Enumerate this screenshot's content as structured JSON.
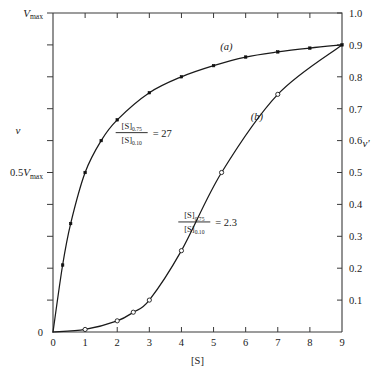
{
  "figure": {
    "background_color": "#ffffff",
    "ink_color": "#1a1a1a",
    "axis_color": "#3a3a3a"
  },
  "chart_data": {
    "type": "line",
    "title": "",
    "subtitle": "",
    "xlabel": "[S]",
    "ylabel": "v",
    "y2label": "v'",
    "xlim": [
      0,
      9
    ],
    "ylim": [
      0,
      1.0
    ],
    "y2lim": [
      0,
      1.0
    ],
    "grid": false,
    "legend_position": "inline-curve-labels",
    "x_ticks": [
      0,
      1,
      2,
      3,
      4,
      5,
      6,
      7,
      8,
      9
    ],
    "x_tick_labels": [
      "0",
      "1",
      "2",
      "3",
      "4",
      "5",
      "6",
      "7",
      "8",
      "9"
    ],
    "y_left_ticks": [
      0.1,
      0.2,
      0.3,
      0.4,
      0.5,
      0.6,
      0.7,
      0.8,
      0.9,
      1.0
    ],
    "y_left_labeled": [
      {
        "value": 1.0,
        "prefix": "",
        "symbol": "V",
        "subscript": "max"
      },
      {
        "value": 0.5,
        "prefix": "0.5",
        "symbol": "V",
        "subscript": "max"
      },
      {
        "value": 0.0,
        "prefix": "0",
        "symbol": "",
        "subscript": ""
      }
    ],
    "y_right_ticks": [
      0.1,
      0.2,
      0.3,
      0.4,
      0.5,
      0.6,
      0.7,
      0.8,
      0.9,
      1.0
    ],
    "y_right_tick_labels": [
      "0.1",
      "0.2",
      "0.3",
      "0.4",
      "0.5",
      "0.6",
      "0.7",
      "0.8",
      "0.9",
      "1.0"
    ],
    "series": [
      {
        "name": "(a)",
        "label": "(a)",
        "marker": "filled-square",
        "description": "hyperbolic Michaelis-Menten saturation curve",
        "points": [
          {
            "x": 0.0,
            "y": 0.0
          },
          {
            "x": 0.3,
            "y": 0.21
          },
          {
            "x": 0.55,
            "y": 0.34
          },
          {
            "x": 1.0,
            "y": 0.5
          },
          {
            "x": 1.5,
            "y": 0.6
          },
          {
            "x": 2.0,
            "y": 0.665
          },
          {
            "x": 3.0,
            "y": 0.75
          },
          {
            "x": 4.0,
            "y": 0.8
          },
          {
            "x": 5.0,
            "y": 0.835
          },
          {
            "x": 6.0,
            "y": 0.862
          },
          {
            "x": 7.0,
            "y": 0.878
          },
          {
            "x": 8.0,
            "y": 0.89
          },
          {
            "x": 9.0,
            "y": 0.9
          }
        ]
      },
      {
        "name": "(b)",
        "label": "(b)",
        "marker": "open-circle",
        "description": "sigmoidal cooperative saturation curve",
        "points": [
          {
            "x": 0.0,
            "y": 0.0
          },
          {
            "x": 1.0,
            "y": 0.008
          },
          {
            "x": 2.0,
            "y": 0.035
          },
          {
            "x": 2.5,
            "y": 0.062
          },
          {
            "x": 3.0,
            "y": 0.1
          },
          {
            "x": 4.0,
            "y": 0.255
          },
          {
            "x": 5.25,
            "y": 0.5
          },
          {
            "x": 7.0,
            "y": 0.745
          },
          {
            "x": 9.0,
            "y": 0.9
          }
        ]
      }
    ],
    "annotations": [
      {
        "id": "ratio-a",
        "numerator": "[S]",
        "numerator_sub": "0.75",
        "denominator": "[S]",
        "denominator_sub": "0.10",
        "equals": "= 27",
        "value": 27,
        "for_series": "(a)"
      },
      {
        "id": "ratio-b",
        "numerator": "[S]",
        "numerator_sub": "0.75",
        "denominator": "[S]",
        "denominator_sub": "0.10",
        "equals": "= 2.3",
        "value": 2.3,
        "for_series": "(b)"
      }
    ]
  }
}
